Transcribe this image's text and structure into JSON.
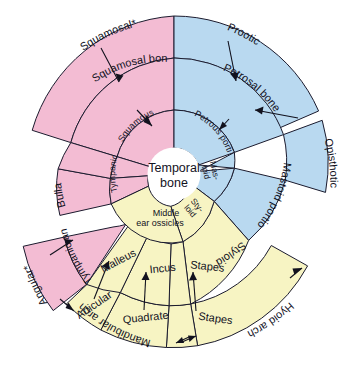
{
  "diagram": {
    "title": "Temporal bone",
    "type": "radial-sunburst",
    "center_label_line1": "Temporal",
    "center_label_line2": "bone",
    "colors": {
      "pink": "#f3bcd3",
      "blue": "#b9d9f0",
      "yellow": "#f7f4c3",
      "white": "#ffffff",
      "stroke": "#1b1b2e",
      "text": "#12121e"
    },
    "rings": {
      "inner": {
        "name": "Temporal bone portions",
        "segments": [
          {
            "id": "squamous-portion",
            "label": "Squamous portion",
            "color": "pink"
          },
          {
            "id": "tympanic-portion",
            "label": "Tympanic portion",
            "color": "pink"
          },
          {
            "id": "petrous-portion",
            "label": "Petrous portion",
            "color": "blue"
          },
          {
            "id": "mastoid",
            "label": "Mas- toid",
            "label_line1": "Mas-",
            "label_line2": "toid",
            "color": "blue"
          },
          {
            "id": "styloid",
            "label": "Sty- loid",
            "label_line1": "Sty-",
            "label_line2": "loid",
            "color": "yellow"
          },
          {
            "id": "middle-ear-ossicles",
            "label": "Middle ear ossicles",
            "label_line1": "Middle",
            "label_line2": "ear ossicles",
            "color": "yellow"
          }
        ]
      },
      "middle": {
        "name": "Mammalian homologue bones",
        "segments": [
          {
            "id": "squamosal-bone",
            "label": "Squamosal bone",
            "color": "pink"
          },
          {
            "id": "petrosal-bone",
            "label": "Petrosal bone",
            "color": "blue"
          },
          {
            "id": "mastoid-portion",
            "label": "Mastoid portion",
            "color": "blue"
          },
          {
            "id": "styloid-middle",
            "label": "Styloid",
            "color": "yellow"
          },
          {
            "id": "stapes-middle",
            "label": "Stapes",
            "color": "yellow"
          },
          {
            "id": "incus-middle",
            "label": "Incus",
            "color": "yellow"
          },
          {
            "id": "malleus-middle",
            "label": "Malleus",
            "color": "yellow"
          },
          {
            "id": "tympanic-annulus",
            "label": "Tympanic annulus",
            "color": "pink"
          },
          {
            "id": "bulla",
            "label": "Bulla",
            "color": "pink"
          }
        ]
      },
      "outer": {
        "name": "Reptilian ancestral elements",
        "segments": [
          {
            "id": "squamosal",
            "label": "Squamosal*",
            "color": "pink"
          },
          {
            "id": "prootic",
            "label": "Prootic",
            "color": "blue"
          },
          {
            "id": "opisthotic",
            "label": "Opisthotic",
            "color": "blue"
          },
          {
            "id": "hyoid-arch",
            "label": "Hyoid arch",
            "color": "yellow"
          },
          {
            "id": "stapes-outer",
            "label": "Stapes",
            "color": "yellow"
          },
          {
            "id": "quadrate",
            "label": "Quadrate",
            "color": "yellow"
          },
          {
            "id": "articular",
            "label": "Articular",
            "color": "yellow"
          },
          {
            "id": "mandibular-arch",
            "label": "Mandibular arch",
            "color": "yellow"
          },
          {
            "id": "angular",
            "label": "Angular*",
            "color": "pink"
          }
        ]
      }
    },
    "arch_labels": [
      {
        "id": "mandibular-arch-label",
        "label": "Mandibular arch"
      },
      {
        "id": "hyoid-arch-label",
        "label": "Hyoid arch"
      }
    ],
    "arrows": [
      {
        "from": "Squamosal*",
        "to": "Squamosal bone"
      },
      {
        "from": "Squamosal bone",
        "to": "Squamous portion"
      },
      {
        "from": "Prootic",
        "to": "Petrosal bone"
      },
      {
        "from": "Opisthotic",
        "to": "Petrosal bone"
      },
      {
        "from": "Petrosal bone",
        "to": "Petrous portion"
      },
      {
        "from": "Angular*",
        "to": "Tympanic annulus"
      },
      {
        "from": "Articular",
        "to": "Malleus"
      },
      {
        "from": "Quadrate",
        "to": "Incus"
      },
      {
        "from": "Stapes",
        "to": "Stapes"
      }
    ]
  }
}
